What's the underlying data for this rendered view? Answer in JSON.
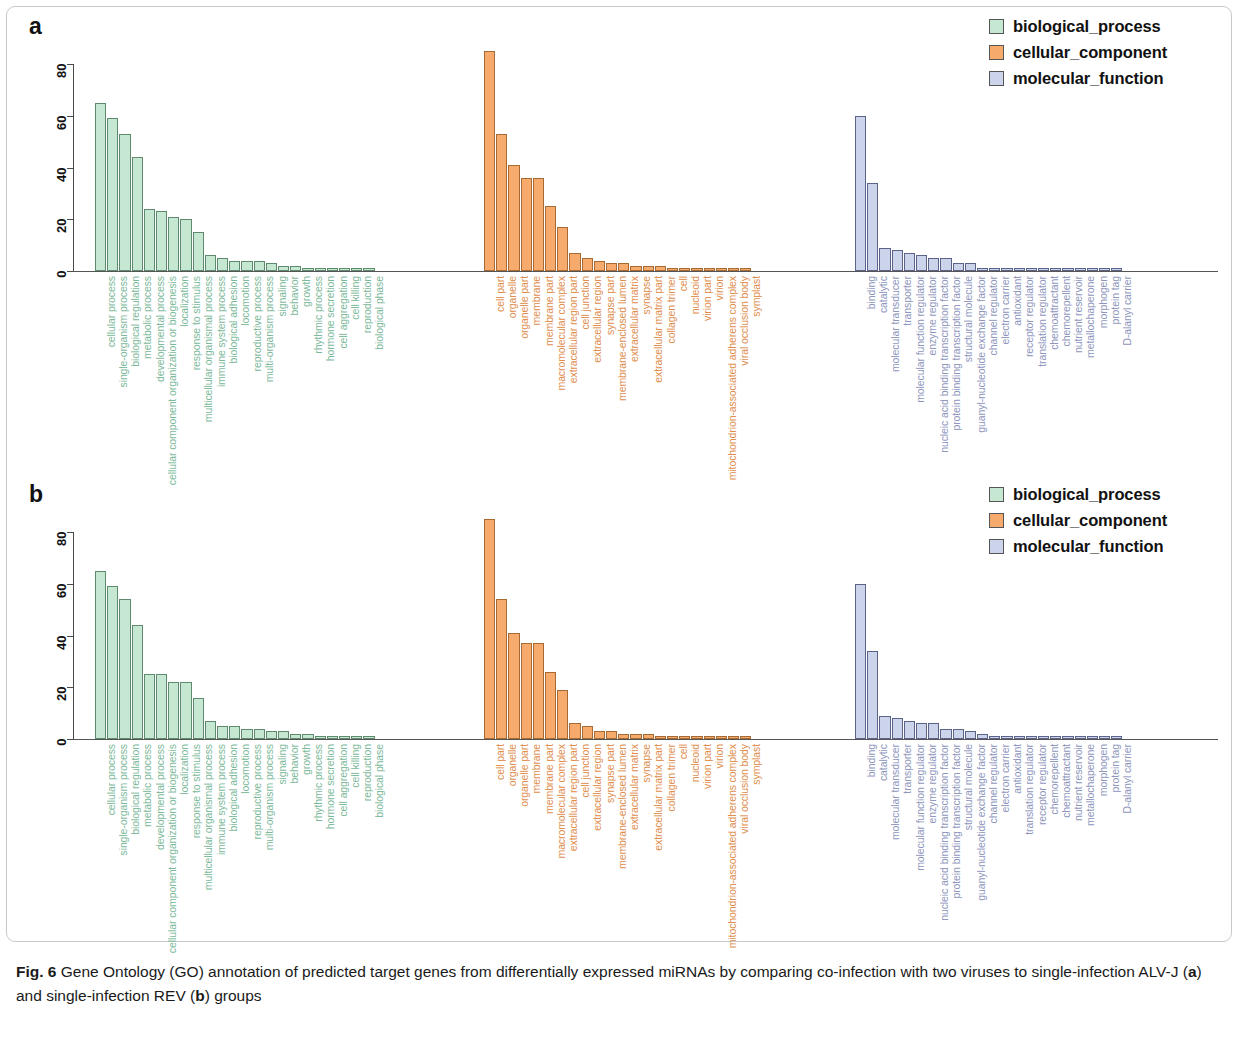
{
  "figure": {
    "number": "Fig. 6",
    "caption_part1": "Gene Ontology (GO) annotation of predicted target genes from differentially expressed miRNAs by comparing co-infection with two viruses to single-infection ALV-J (",
    "caption_a": "a",
    "caption_part2": ") and single-infection REV (",
    "caption_b": "b",
    "caption_part3": ") groups"
  },
  "panels": {
    "a": {
      "label": "a"
    },
    "b": {
      "label": "b"
    }
  },
  "legend": {
    "items": [
      {
        "label": "biological_process",
        "color": "#c6e8d2"
      },
      {
        "label": "cellular_component",
        "color": "#f6ab6c"
      },
      {
        "label": "molecular_function",
        "color": "#ccd4ec"
      }
    ]
  },
  "chart_data": [
    {
      "type": "bar",
      "title": "a",
      "xlabel": "",
      "ylabel": "",
      "ylim": [
        0,
        88
      ],
      "yticks": [
        0,
        20,
        40,
        60,
        80
      ],
      "grid": false,
      "legend_position": "top-right",
      "series": [
        {
          "name": "biological_process",
          "color": "#c6e8d2",
          "categories": [
            "cellular process",
            "single-organism process",
            "biological regulation",
            "metabolic process",
            "developmental process",
            "cellular component organization or biogenesis",
            "localization",
            "response to stimulus",
            "multicellular organismal process",
            "immune system process",
            "biological adhesion",
            "locomotion",
            "reproductive process",
            "multi-organism process",
            "signaling",
            "behavior",
            "growth",
            "rhythmic process",
            "hormone secretion",
            "cell aggregation",
            "cell killing",
            "reproduction",
            "biological phase"
          ],
          "values": [
            65,
            59,
            53,
            44,
            24,
            23,
            21,
            20,
            15,
            6,
            5,
            4,
            4,
            4,
            3,
            2,
            2,
            1,
            1,
            1,
            1,
            1,
            1
          ]
        },
        {
          "name": "cellular_component",
          "color": "#f6ab6c",
          "categories": [
            "cell part",
            "organelle",
            "organelle part",
            "membrane",
            "membrane part",
            "macromolecular complex",
            "extracellular region part",
            "cell junction",
            "extracellular region",
            "synapse part",
            "membrane-enclosed lumen",
            "extracellular matrix",
            "synapse",
            "extracellular matrix part",
            "collagen trimer",
            "cell",
            "nucleoid",
            "virion part",
            "virion",
            "mitochondrion-associated adherens complex",
            "viral occlusion body",
            "symplast"
          ],
          "values": [
            85,
            53,
            41,
            36,
            36,
            25,
            17,
            7,
            5,
            4,
            3,
            3,
            2,
            2,
            2,
            1,
            1,
            1,
            1,
            1,
            1,
            1
          ]
        },
        {
          "name": "molecular_function",
          "color": "#ccd4ec",
          "categories": [
            "binding",
            "catalytic",
            "molecular transducer",
            "transporter",
            "molecular function regulator",
            "enzyme regulator",
            "nucleic acid binding transcription factor",
            "protein binding transcription factor",
            "structural molecule",
            "guanyl-nucleotide exchange factor",
            "channel regulator",
            "electron carrier",
            "antioxidant",
            "receptor regulator",
            "translation regulator",
            "chemoattractant",
            "chemorepellent",
            "nutrient reservoir",
            "metallochaperone",
            "morphogen",
            "protein tag",
            "D-alanyl carrier"
          ],
          "values": [
            60,
            34,
            9,
            8,
            7,
            6,
            5,
            5,
            3,
            3,
            1,
            1,
            1,
            1,
            1,
            1,
            1,
            1,
            1,
            1,
            1,
            1
          ]
        }
      ]
    },
    {
      "type": "bar",
      "title": "b",
      "xlabel": "",
      "ylabel": "",
      "ylim": [
        0,
        88
      ],
      "yticks": [
        0,
        20,
        40,
        60,
        80
      ],
      "grid": false,
      "legend_position": "top-right",
      "series": [
        {
          "name": "biological_process",
          "color": "#c6e8d2",
          "categories": [
            "cellular process",
            "single-organism process",
            "biological regulation",
            "metabolic process",
            "developmental process",
            "cellular component organization or biogenesis",
            "localization",
            "response to stimulus",
            "multicellular organismal process",
            "immune system process",
            "biological adhesion",
            "locomotion",
            "reproductive process",
            "multi-organism process",
            "signaling",
            "behavior",
            "growth",
            "rhythmic process",
            "hormone secretion",
            "cell aggregation",
            "cell killing",
            "reproduction",
            "biological phase"
          ],
          "values": [
            65,
            59,
            54,
            44,
            25,
            25,
            22,
            22,
            16,
            7,
            5,
            5,
            4,
            4,
            3,
            3,
            2,
            2,
            1,
            1,
            1,
            1,
            1
          ]
        },
        {
          "name": "cellular_component",
          "color": "#f6ab6c",
          "categories": [
            "cell part",
            "organelle",
            "organelle part",
            "membrane",
            "membrane part",
            "macromolecular complex",
            "extracellular region part",
            "cell junction",
            "extracellular region",
            "synapse part",
            "membrane-enclosed lumen",
            "extracellular matrix",
            "synapse",
            "extracellular matrix part",
            "collagen trimer",
            "cell",
            "nucleoid",
            "virion part",
            "virion",
            "mitochondrion-associated adherens complex",
            "viral occlusion body",
            "symplast"
          ],
          "values": [
            85,
            54,
            41,
            37,
            37,
            26,
            19,
            6,
            5,
            3,
            3,
            2,
            2,
            2,
            1,
            1,
            1,
            1,
            1,
            1,
            1,
            1
          ]
        },
        {
          "name": "molecular_function",
          "color": "#ccd4ec",
          "categories": [
            "binding",
            "catalytic",
            "molecular transducer",
            "transporter",
            "molecular function regulator",
            "enzyme regulator",
            "nucleic acid binding transcription factor",
            "protein binding transcription factor",
            "structural molecule",
            "guanyl-nucleotide exchange factor",
            "channel regulator",
            "electron carrier",
            "antioxidant",
            "translation regulator",
            "receptor regulator",
            "chemorepellent",
            "chemoattractant",
            "nutrient reservoir",
            "metallochaperone",
            "morphogen",
            "protein tag",
            "D-alanyl carrier"
          ],
          "values": [
            60,
            34,
            9,
            8,
            7,
            6,
            6,
            4,
            4,
            3,
            2,
            1,
            1,
            1,
            1,
            1,
            1,
            1,
            1,
            1,
            1,
            1
          ]
        }
      ]
    }
  ]
}
